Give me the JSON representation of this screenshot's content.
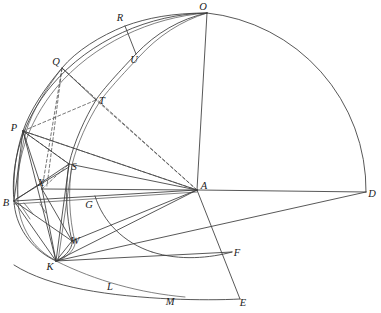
{
  "figure": {
    "canvas": {
      "width": 381,
      "height": 313
    },
    "background_color": "#ffffff",
    "line_color": "#3a3a3a",
    "label_color": "#1a1a1a"
  },
  "points": {
    "O": {
      "label": "O",
      "x": 207,
      "y": 13,
      "label_x": 203,
      "label_y": 10
    },
    "R": {
      "label": "R",
      "x": 125,
      "y": 26,
      "label_x": 120,
      "label_y": 21
    },
    "U": {
      "label": "U",
      "x": 136,
      "y": 54,
      "label_x": 132,
      "label_y": 60
    },
    "Q": {
      "label": "Q",
      "x": 62,
      "y": 68,
      "label_x": 56,
      "label_y": 64
    },
    "T": {
      "label": "T",
      "x": 96,
      "y": 100,
      "label_x": 99,
      "label_y": 102
    },
    "P": {
      "label": "P",
      "x": 23,
      "y": 131,
      "label_x": 16,
      "label_y": 129
    },
    "S": {
      "label": "S",
      "x": 69,
      "y": 164,
      "label_x": 71,
      "label_y": 166
    },
    "X": {
      "label": "X",
      "x": 42,
      "y": 189,
      "label_x": 39,
      "label_y": 187
    },
    "B": {
      "label": "B",
      "x": 14,
      "y": 201,
      "label_x": 5,
      "label_y": 205
    },
    "A": {
      "label": "A",
      "x": 197,
      "y": 190,
      "label_x": 201,
      "label_y": 188
    },
    "D": {
      "label": "D",
      "x": 366,
      "y": 192,
      "label_x": 369,
      "label_y": 196
    },
    "G": {
      "label": "G",
      "x": 88,
      "y": 203,
      "label_x": 86,
      "label_y": 206
    },
    "W": {
      "label": "W",
      "x": 72,
      "y": 241,
      "label_x": 70,
      "label_y": 243
    },
    "K": {
      "label": "K",
      "x": 56,
      "y": 261,
      "label_x": 50,
      "label_y": 267
    },
    "L": {
      "label": "L",
      "x": 112,
      "y": 285,
      "label_x": 109,
      "label_y": 288
    },
    "M": {
      "label": "M",
      "x": 172,
      "y": 299,
      "label_x": 169,
      "label_y": 302
    },
    "F": {
      "label": "F",
      "x": 232,
      "y": 252,
      "label_x": 234,
      "label_y": 254
    },
    "E": {
      "label": "E",
      "x": 240,
      "y": 299,
      "label_x": 240,
      "label_y": 303
    }
  },
  "labels": [
    "O",
    "R",
    "U",
    "Q",
    "T",
    "P",
    "S",
    "X",
    "B",
    "A",
    "D",
    "G",
    "W",
    "K",
    "L",
    "M",
    "F",
    "E"
  ]
}
